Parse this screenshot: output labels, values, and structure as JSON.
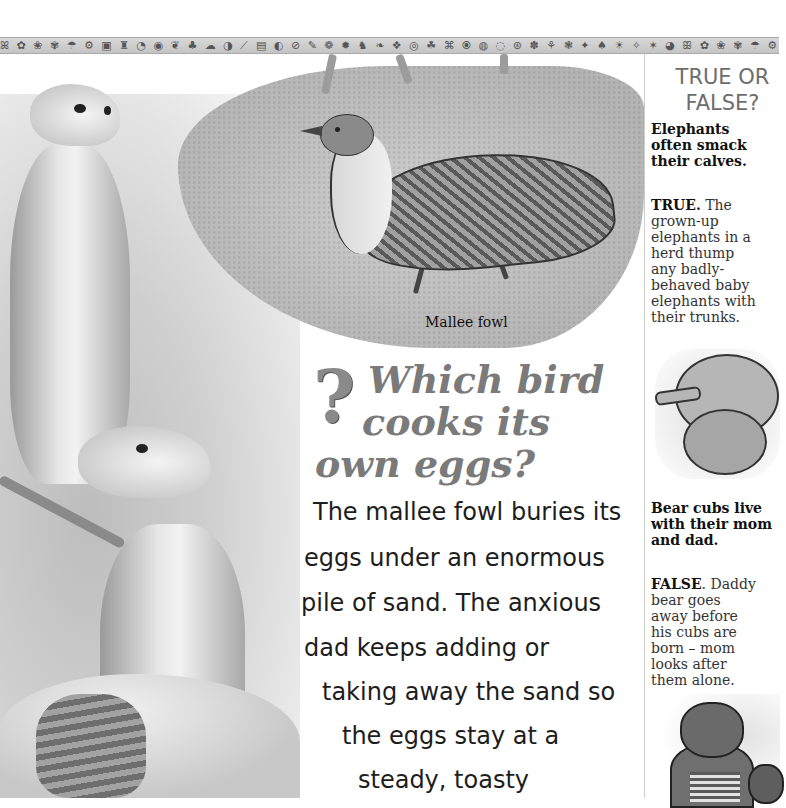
{
  "header": {
    "icon_strip_glyphs": "ꕤ ✿ ❀ ✾ ☂ ⚙ ▣ ♜ ◔ ◉ ❦ ♣ ☁ ◑ ⟋ ▤ ◐ ⊘ ✎ ❁ ✹ ♞ ❧ ❖ ◎ ☘ ⌘ ⦿ ◍ ◌ ⊛ ✽ ⚘ ❃ ✦ ♠ ☀ ✧ ✶ ◕ ꕥ ✿ ❀ ✾ ☂ ⚙ ▣ ♜ ◔ ◉ ❦ ♣ ☁"
  },
  "main": {
    "illustration_caption": "Mallee fowl",
    "question": {
      "icon": "question-mark-icon",
      "glyph": "?",
      "lines": [
        "Which bird",
        "cooks its",
        "own eggs?"
      ]
    },
    "body_lines": [
      "The mallee fowl buries its",
      "eggs under an enormous",
      "pile of sand. The anxious",
      "dad keeps adding or",
      "taking away the sand so",
      "the eggs stay at a",
      "steady, toasty"
    ]
  },
  "sidebar": {
    "title_lines": [
      "TRUE OR",
      "FALSE?"
    ],
    "items": [
      {
        "question_lines": [
          "Elephants",
          "often smack",
          "their calves."
        ],
        "verdict": "TRUE.",
        "answer_lines": [
          " The",
          "grown-up",
          "elephants in a",
          "herd thump",
          "any badly-",
          "behaved baby",
          "elephants with",
          "their trunks."
        ],
        "illustration": "elephants-illustration"
      },
      {
        "question_lines": [
          "Bear cubs live",
          "with their mom",
          "and dad."
        ],
        "verdict": "FALSE",
        "answer_lines": [
          ". Daddy",
          "bear goes",
          "away before",
          "his cubs are",
          "born – mom",
          "looks after",
          "them alone."
        ],
        "illustration": "bears-illustration"
      }
    ]
  },
  "colors": {
    "headline_gray": "#7a7a7a",
    "body_text": "#1d1d1d",
    "sidebar_title": "#6d6d6d",
    "divider": "#cfcfcf"
  }
}
